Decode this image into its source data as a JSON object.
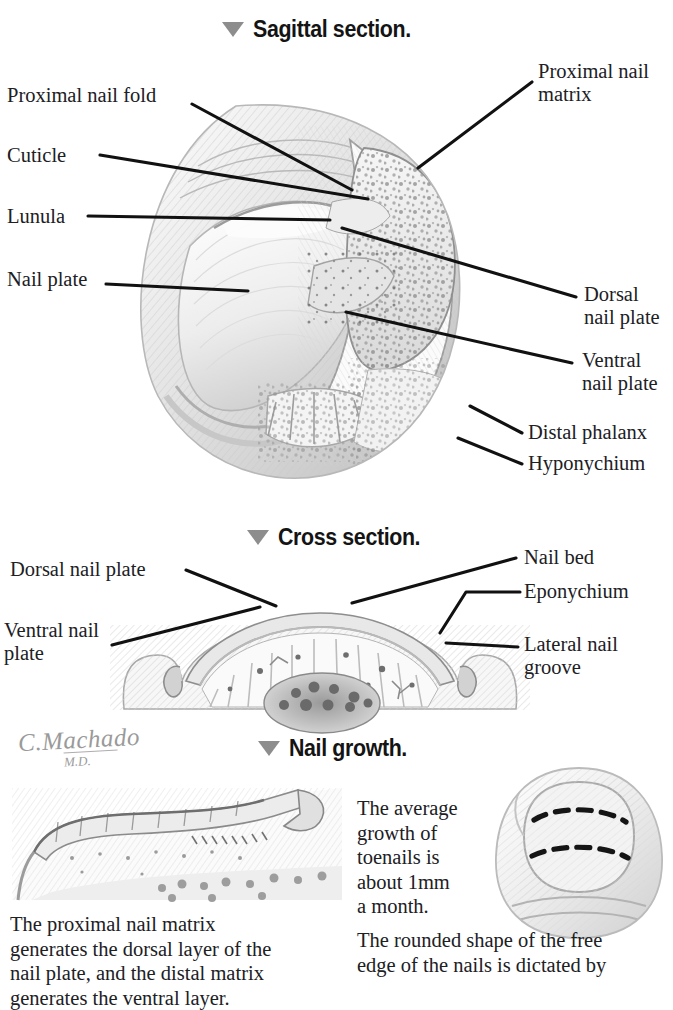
{
  "sections": [
    {
      "id": "sagittal",
      "marker": "triangle-down-icon",
      "title": "Sagittal section."
    },
    {
      "id": "cross",
      "marker": "triangle-down-icon",
      "title": "Cross section."
    },
    {
      "id": "growth",
      "marker": "triangle-down-icon",
      "title": "Nail growth."
    }
  ],
  "sagittal": {
    "labels_left": [
      {
        "id": "proximal-nail-fold",
        "text": "Proximal nail fold"
      },
      {
        "id": "cuticle",
        "text": "Cuticle"
      },
      {
        "id": "lunula",
        "text": "Lunula"
      },
      {
        "id": "nail-plate",
        "text": "Nail plate"
      }
    ],
    "labels_right": [
      {
        "id": "proximal-nail-matrix",
        "text": "Proximal nail\nmatrix"
      },
      {
        "id": "dorsal-nail-plate",
        "text": "Dorsal\nnail plate"
      },
      {
        "id": "ventral-nail-plate",
        "text": "Ventral\nnail plate"
      },
      {
        "id": "distal-phalanx",
        "text": "Distal phalanx"
      },
      {
        "id": "hyponychium",
        "text": "Hyponychium"
      }
    ]
  },
  "cross": {
    "labels_left": [
      {
        "id": "dorsal-nail-plate",
        "text": "Dorsal nail plate"
      },
      {
        "id": "ventral-nail-plate",
        "text": "Ventral nail\n    plate"
      }
    ],
    "labels_right": [
      {
        "id": "nail-bed",
        "text": "Nail bed"
      },
      {
        "id": "eponychium",
        "text": "Eponychium"
      },
      {
        "id": "lateral-nail-groove",
        "text": "Lateral nail\ngroove"
      }
    ]
  },
  "growth": {
    "caption_middle": "The average\ngrowth of\ntoenails is\nabout 1mm\na month.",
    "caption_left": "The proximal nail matrix\ngenerates the dorsal layer of the\nnail plate, and the distal matrix\ngenerates the ventral layer.",
    "caption_right": "The rounded shape of the free\nedge of the nails is dictated by"
  },
  "signature": {
    "name": "C.Machado",
    "credential": "M.D."
  },
  "colors": {
    "ink": "#20201f",
    "leader": "#111111",
    "marker_gray": "#8d8d8d",
    "art_light": "#e9e9e9",
    "art_mid": "#bdbdbd",
    "art_dark": "#7d7d7d",
    "background": "#ffffff"
  }
}
